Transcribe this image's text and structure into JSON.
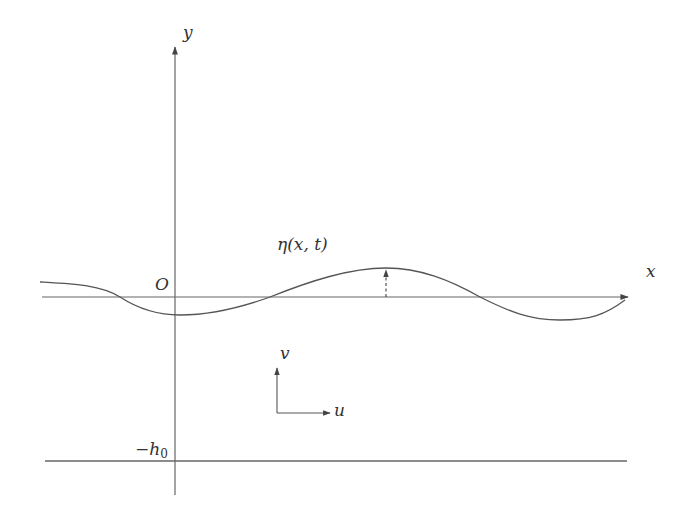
{
  "diagram": {
    "title": "",
    "labels": {
      "y_axis": "y",
      "x_axis": "x",
      "origin": "O",
      "surface": "η(x, t)",
      "velocity_v": "v",
      "velocity_u": "u",
      "bottom_sign": "−h",
      "bottom_sub": "0"
    },
    "elements": [
      {
        "id": "y-axis",
        "type": "arrow",
        "from": [
          175,
          495
        ],
        "to": [
          175,
          45
        ]
      },
      {
        "id": "x-axis",
        "type": "arrow",
        "from": [
          42,
          297
        ],
        "to": [
          630,
          297
        ]
      },
      {
        "id": "free-surface",
        "type": "curve",
        "description": "wavy free surface η(x,t) crossing x-axis near x=120, 270, 480"
      },
      {
        "id": "eta-marker",
        "type": "dashed-arrow",
        "from": [
          386,
          297
        ],
        "to": [
          386,
          268
        ]
      },
      {
        "id": "v-arrow",
        "type": "arrow",
        "from": [
          277,
          413
        ],
        "to": [
          277,
          367
        ]
      },
      {
        "id": "u-arrow",
        "type": "arrow",
        "from": [
          277,
          413
        ],
        "to": [
          330,
          413
        ]
      },
      {
        "id": "bottom",
        "type": "line",
        "from": [
          45,
          461
        ],
        "to": [
          627,
          461
        ]
      }
    ],
    "colors": {
      "stroke": "#555555",
      "text": "#333333",
      "background": "#ffffff"
    }
  }
}
